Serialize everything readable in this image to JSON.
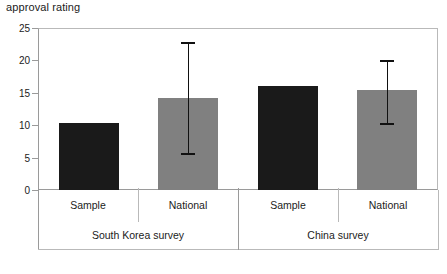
{
  "chart_data": {
    "type": "bar",
    "title": "approval rating",
    "xlabel": "",
    "ylabel": "",
    "ylim": [
      0,
      25
    ],
    "yticks": [
      0,
      5,
      10,
      15,
      20,
      25
    ],
    "grid": false,
    "legend": false,
    "categories": [
      "Sample",
      "National",
      "Sample",
      "National"
    ],
    "groups": [
      {
        "label": "South Korea survey",
        "span": 2
      },
      {
        "label": "China survey",
        "span": 2
      }
    ],
    "values": [
      10.3,
      14.2,
      16.0,
      15.5
    ],
    "errors": [
      null,
      {
        "low": 5.7,
        "high": 22.9
      },
      null,
      {
        "low": 10.4,
        "high": 20.1
      }
    ],
    "bar_colors": [
      "#1a1a1a",
      "#808080",
      "#1a1a1a",
      "#808080"
    ],
    "series": [
      {
        "name": "approval rating",
        "points": [
          {
            "category": "Sample",
            "group": "South Korea survey",
            "value": 10.3,
            "color": "#1a1a1a",
            "err_low": null,
            "err_high": null
          },
          {
            "category": "National",
            "group": "South Korea survey",
            "value": 14.2,
            "color": "#808080",
            "err_low": 5.7,
            "err_high": 22.9
          },
          {
            "category": "Sample",
            "group": "China survey",
            "value": 16.0,
            "color": "#1a1a1a",
            "err_low": null,
            "err_high": null
          },
          {
            "category": "National",
            "group": "China survey",
            "value": 15.5,
            "color": "#808080",
            "err_low": 10.4,
            "err_high": 20.1
          }
        ]
      }
    ]
  },
  "yticklabels": [
    "25",
    "20",
    "15",
    "10",
    "5",
    "0"
  ]
}
